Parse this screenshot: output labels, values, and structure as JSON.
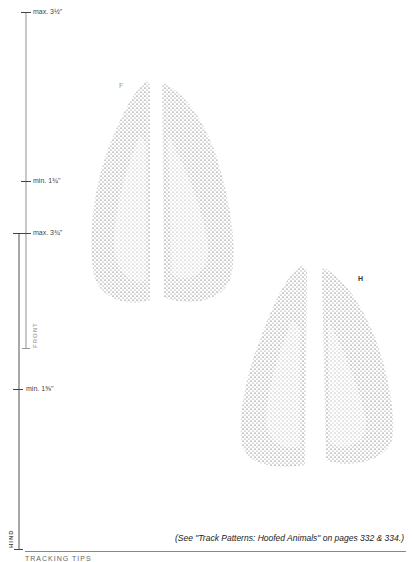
{
  "scale": {
    "front": {
      "label": "FRONT",
      "max": "max. 3½\"",
      "min": "min. 1¾\""
    },
    "hind": {
      "label": "HIND",
      "max": "max. 3¾\"",
      "min": "min. 1⅝\""
    }
  },
  "tracks": {
    "front_label": "F",
    "hind_label": "H"
  },
  "caption": "(See \"Track Patterns: Hoofed Animals\" on pages 332 & 334.)",
  "footer_header": "TRACKING TIPS",
  "colors": {
    "front_bar": "#c4c4c4",
    "hind_bar": "#a8a8a8",
    "dots": "#333333"
  }
}
